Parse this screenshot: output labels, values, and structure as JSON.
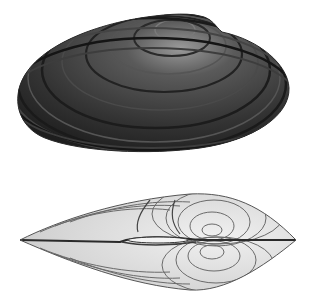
{
  "image": {
    "description": "Engraved illustration of a freshwater mussel shell shown in two views",
    "background": "#ffffff",
    "views": [
      {
        "name": "lateral view",
        "label": "Dark shell, side view with concentric growth rings",
        "color": "#3a3a3a"
      },
      {
        "name": "dorsal view",
        "label": "Pale shell, top view showing hinge line",
        "color": "#d8d8d8"
      }
    ]
  }
}
